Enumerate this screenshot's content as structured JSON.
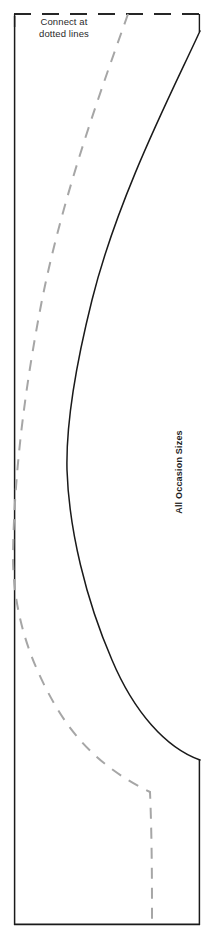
{
  "document": {
    "title": "Pattern Piece Template",
    "background_color": "#ffffff",
    "width": 218,
    "height": 943
  },
  "annotations": {
    "connect_note": "Connect at\ndotted lines",
    "right_edge_label": "All Occasion Sizes",
    "left_edge_label": "Size"
  },
  "colors": {
    "cut_line": "#1a1a1a",
    "seam_line": "#a6a6a6",
    "connect_dash": "#262626",
    "paper": "#ffffff",
    "text": "#2a2a2a"
  },
  "geometry": {
    "connect_top_line": {
      "name": "connect-at-dotted-line",
      "style": "dashed",
      "y": 14,
      "x_start": 14,
      "x_end": 200,
      "dash": "17 11"
    },
    "corner_stub_left": {
      "x": 14,
      "y_start": 14,
      "y_end": 26
    },
    "corner_stub_right": {
      "x": 200,
      "y_start": 14,
      "y_end": 31
    },
    "left_fold_edge": {
      "x": 14,
      "y_start": 16,
      "y_end": 925
    },
    "bottom_edge": {
      "y": 925,
      "x_start": 14,
      "x_end": 200
    },
    "right_lower_edge": {
      "x": 200,
      "y_start": 760,
      "y_end": 925
    },
    "cut_curve_path": "M200,31 C172,92 118,196 92,300 C72,380 66,430 67,470 C69,530 86,600 112,660 C134,712 166,748 200,760",
    "seam_curve_path": "M128,14 C104,82 64,190 42,300 C26,382 14,470 13,556 C13,610 28,660 58,710 C86,756 122,778 150,792 C152,840 152,884 152,925"
  },
  "layers": [
    {
      "name": "cut-line",
      "label": "Cutting line",
      "style": "solid"
    },
    {
      "name": "seam-line",
      "label": "Seam / placement line",
      "style": "dashed"
    }
  ]
}
